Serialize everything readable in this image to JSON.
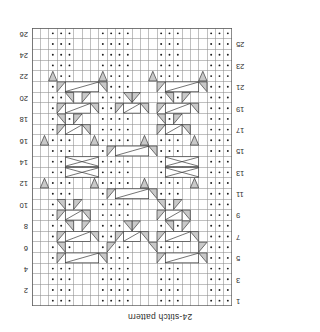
{
  "title": "24-stitch pattern",
  "chart_data": {
    "type": "table",
    "title": "24-stitch pattern",
    "kind": "knitting-cable-chart",
    "stitch_count": 24,
    "row_count": 26,
    "orientation": "rotated-180",
    "colors": {
      "grid_line": "#8c8c8c",
      "border": "#5a5a5a",
      "symbol": "#3a3a3a",
      "symbol_fill": "#c9c9c9",
      "dot": "#1a1a1a",
      "text": "#2b2b2b",
      "background": "#ffffff"
    },
    "legend": [
      {
        "symbol": "dot",
        "name": "purl-stitch"
      },
      {
        "symbol": "blank",
        "name": "knit-stitch"
      },
      {
        "symbol": "right-twist",
        "name": "right-leaning-cable"
      },
      {
        "symbol": "left-twist",
        "name": "left-leaning-cable"
      },
      {
        "symbol": "cross",
        "name": "cable-cross-4"
      }
    ],
    "row_numbers_odd_side": "left",
    "row_numbers_even_side": "right",
    "row_numbers": [
      1,
      2,
      3,
      4,
      5,
      6,
      7,
      8,
      9,
      10,
      11,
      12,
      13,
      14,
      15,
      16,
      17,
      18,
      19,
      20,
      21,
      22,
      23,
      24,
      25,
      26
    ],
    "xlabel": "",
    "ylabel": "",
    "grid": true,
    "cells": [
      "PPP..PPP...PPPP..PPP..PPP",
      "PPP..PPP...PPPP..PPP..PPP",
      "PPP..PPP...PPPP..PPP..PPP",
      "PPP..PPP...PPPP..PPP..PPP"
    ],
    "purl_columns_by_row": [
      [
        0,
        1,
        2,
        6,
        7,
        8,
        12,
        13,
        14,
        15,
        19,
        20,
        21
      ],
      [
        0,
        1,
        2,
        6,
        7,
        8,
        12,
        13,
        14,
        15,
        19,
        20,
        21
      ],
      [
        0,
        1,
        2,
        6,
        7,
        8,
        12,
        13,
        14,
        15,
        19,
        20,
        21
      ],
      [
        0,
        1,
        2,
        6,
        7,
        8,
        12,
        13,
        14,
        15,
        19,
        20,
        21
      ]
    ]
  }
}
